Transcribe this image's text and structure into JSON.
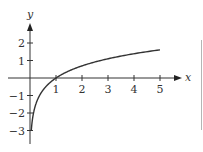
{
  "chart_data": {
    "type": "line",
    "title": "",
    "function": "y = ln(x)",
    "xlabel": "x",
    "ylabel": "y",
    "x_ticks": [
      1,
      2,
      3,
      4,
      5
    ],
    "y_ticks": [
      2,
      1,
      -1,
      -2,
      -3
    ],
    "x_tick_labels": [
      "1",
      "2",
      "3",
      "4",
      "5"
    ],
    "y_tick_labels": [
      "2",
      "1",
      "−1",
      "−2",
      "−3"
    ],
    "xlim": [
      0,
      5.6
    ],
    "ylim": [
      -3.8,
      3
    ],
    "grid": false,
    "legend": null,
    "series": [
      {
        "name": "ln(x)",
        "x": [
          0.05,
          0.1,
          0.2,
          0.3,
          0.5,
          0.75,
          1,
          1.5,
          2,
          2.5,
          3,
          3.5,
          4,
          4.5,
          5
        ],
        "values": [
          -3.0,
          -2.3,
          -1.61,
          -1.2,
          -0.69,
          -0.29,
          0,
          0.41,
          0.69,
          0.92,
          1.1,
          1.25,
          1.39,
          1.5,
          1.61
        ]
      }
    ],
    "colors": {
      "curve": "#333333",
      "axes": "#333333"
    }
  }
}
